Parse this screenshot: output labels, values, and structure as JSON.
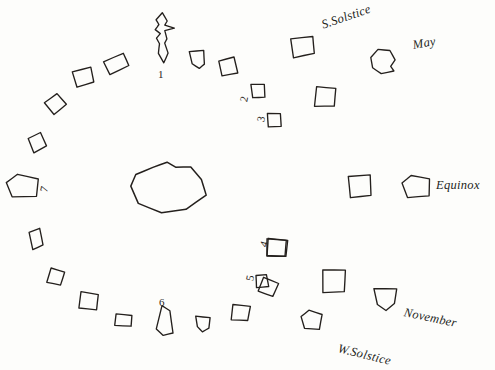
{
  "figure": {
    "title": "",
    "background_color": "#fdfdfb",
    "ink_color": "#24201d"
  },
  "season_labels": [
    {
      "text": "S.Solstice",
      "x": 322,
      "y": 18,
      "rotate": -19
    },
    {
      "text": "May",
      "x": 413,
      "y": 38,
      "rotate": -10
    },
    {
      "text": "Equinox",
      "x": 436,
      "y": 178,
      "rotate": 0
    },
    {
      "text": "November",
      "x": 404,
      "y": 305,
      "rotate": 12
    },
    {
      "text": "W.Solstice",
      "x": 338,
      "y": 341,
      "rotate": 14
    }
  ],
  "number_labels": [
    {
      "text": "1",
      "x": 158,
      "y": 68,
      "rotate": 0
    },
    {
      "text": "2",
      "x": 241,
      "y": 93,
      "rotate": -78
    },
    {
      "text": "3",
      "x": 258,
      "y": 113,
      "rotate": -78
    },
    {
      "text": "4",
      "x": 261,
      "y": 238,
      "rotate": -74
    },
    {
      "text": "5",
      "x": 247,
      "y": 272,
      "rotate": -78
    },
    {
      "text": "6",
      "x": 159,
      "y": 296,
      "rotate": 0
    },
    {
      "text": "7",
      "x": 41,
      "y": 183,
      "rotate": -76
    }
  ],
  "chart_data": {
    "type": "scatter",
    "title": "",
    "xlabel": "",
    "ylabel": "",
    "center_blob": {
      "x": 168,
      "y": 186
    },
    "ring_shapes": [
      {
        "id": "flame",
        "x": 162,
        "y": 38,
        "w": 26,
        "h": 50,
        "rotate": 0,
        "kind": "flame"
      },
      {
        "id": "s01",
        "x": 116,
        "y": 64,
        "w": 23,
        "h": 15,
        "rotate": -22,
        "kind": "quad"
      },
      {
        "id": "s02",
        "x": 83,
        "y": 77,
        "w": 20,
        "h": 17,
        "rotate": -12,
        "kind": "quad"
      },
      {
        "id": "s03",
        "x": 55,
        "y": 104,
        "w": 18,
        "h": 15,
        "rotate": -35,
        "kind": "quad"
      },
      {
        "id": "s04",
        "x": 37,
        "y": 143,
        "w": 15,
        "h": 16,
        "rotate": -20,
        "kind": "quad"
      },
      {
        "id": "s05",
        "x": 22,
        "y": 186,
        "w": 32,
        "h": 22,
        "rotate": 3,
        "kind": "pent"
      },
      {
        "id": "s06",
        "x": 36,
        "y": 239,
        "w": 12,
        "h": 19,
        "rotate": -12,
        "kind": "quad"
      },
      {
        "id": "s07",
        "x": 55,
        "y": 277,
        "w": 15,
        "h": 15,
        "rotate": 20,
        "kind": "quad"
      },
      {
        "id": "s08",
        "x": 88,
        "y": 301,
        "w": 20,
        "h": 17,
        "rotate": 12,
        "kind": "quad"
      },
      {
        "id": "s09",
        "x": 123,
        "y": 320,
        "w": 18,
        "h": 12,
        "rotate": 8,
        "kind": "quad"
      },
      {
        "id": "s10",
        "x": 165,
        "y": 320,
        "w": 20,
        "h": 30,
        "rotate": 0,
        "kind": "tall"
      },
      {
        "id": "s11",
        "x": 203,
        "y": 324,
        "w": 15,
        "h": 15,
        "rotate": 0,
        "kind": "half"
      },
      {
        "id": "s12",
        "x": 240,
        "y": 313,
        "w": 18,
        "h": 16,
        "rotate": 12,
        "kind": "quad"
      },
      {
        "id": "s13",
        "x": 268,
        "y": 287,
        "w": 18,
        "h": 16,
        "rotate": 28,
        "kind": "quad"
      },
      {
        "id": "s14",
        "x": 277,
        "y": 248,
        "w": 21,
        "h": 18,
        "rotate": 8,
        "kind": "quad"
      },
      {
        "id": "s15",
        "x": 311,
        "y": 320,
        "w": 20,
        "h": 19,
        "rotate": 6,
        "kind": "pent"
      },
      {
        "id": "s16",
        "x": 333,
        "y": 281,
        "w": 24,
        "h": 24,
        "rotate": 5,
        "kind": "quad"
      },
      {
        "id": "s17",
        "x": 385,
        "y": 299,
        "w": 24,
        "h": 22,
        "rotate": 0,
        "kind": "cup"
      },
      {
        "id": "s18",
        "x": 416,
        "y": 186,
        "w": 28,
        "h": 22,
        "rotate": 0,
        "kind": "pent"
      },
      {
        "id": "s19",
        "x": 360,
        "y": 186,
        "w": 30,
        "h": 30,
        "rotate": 42,
        "kind": "diamond"
      },
      {
        "id": "s20",
        "x": 383,
        "y": 61,
        "w": 26,
        "h": 24,
        "rotate": 0,
        "kind": "blob"
      },
      {
        "id": "s21",
        "x": 302,
        "y": 47,
        "w": 24,
        "h": 19,
        "rotate": -4,
        "kind": "quad"
      },
      {
        "id": "s22",
        "x": 325,
        "y": 97,
        "w": 22,
        "h": 20,
        "rotate": 8,
        "kind": "quad"
      },
      {
        "id": "s23",
        "x": 258,
        "y": 91,
        "w": 19,
        "h": 18,
        "rotate": 40,
        "kind": "diamond"
      },
      {
        "id": "s24",
        "x": 274,
        "y": 120,
        "w": 19,
        "h": 18,
        "rotate": 40,
        "kind": "diamond"
      },
      {
        "id": "s25",
        "x": 276,
        "y": 248,
        "w": 20,
        "h": 18,
        "rotate": 6,
        "kind": "quad"
      },
      {
        "id": "s26",
        "x": 262,
        "y": 281,
        "w": 16,
        "h": 16,
        "rotate": 38,
        "kind": "diamond"
      },
      {
        "id": "s27",
        "x": 228,
        "y": 67,
        "w": 17,
        "h": 17,
        "rotate": -8,
        "kind": "quad"
      },
      {
        "id": "s28",
        "x": 198,
        "y": 60,
        "w": 16,
        "h": 18,
        "rotate": -8,
        "kind": "half"
      }
    ]
  }
}
